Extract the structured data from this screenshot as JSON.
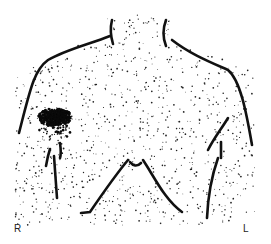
{
  "figure": {
    "type": "nuclear-scintigraphy-chest-anterior",
    "labels": {
      "right": "R",
      "left": "L"
    },
    "colors": {
      "outline": "#111111",
      "dots": "#222222",
      "hotspot": "#0a0a0a",
      "background": "#ffffff"
    },
    "hotspot": {
      "side": "right",
      "region": "right axilla / lateral chest",
      "cx": 55,
      "cy": 117
    }
  }
}
